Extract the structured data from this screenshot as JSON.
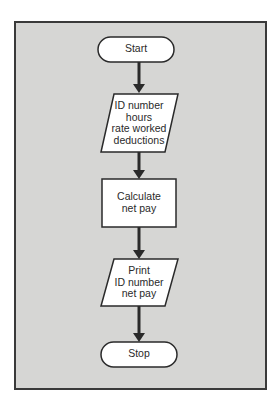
{
  "diagram": {
    "type": "flowchart",
    "panel_color": "#d6d6d4",
    "border_color": "#3a3a3a",
    "nodes": [
      {
        "id": "start",
        "shape": "terminator",
        "label": "Start"
      },
      {
        "id": "input",
        "shape": "parallelogram",
        "label": "ID number\nhours\nrate worked\ndeductions"
      },
      {
        "id": "process",
        "shape": "rectangle",
        "label": "Calculate\nnet pay"
      },
      {
        "id": "output",
        "shape": "parallelogram",
        "label": "Print\nID number\nnet pay"
      },
      {
        "id": "stop",
        "shape": "terminator",
        "label": "Stop"
      }
    ],
    "edges": [
      {
        "from": "start",
        "to": "input"
      },
      {
        "from": "input",
        "to": "process"
      },
      {
        "from": "process",
        "to": "output"
      },
      {
        "from": "output",
        "to": "stop"
      }
    ]
  }
}
